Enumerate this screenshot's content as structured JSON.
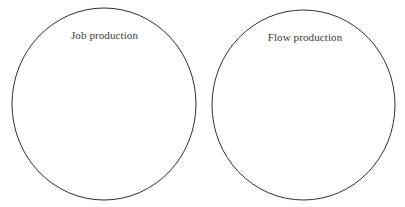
{
  "diagram": {
    "type": "two-set-venn-diagram",
    "background_color": "#ffffff",
    "stroke_color": "#2f2f2f",
    "stroke_width": 1,
    "label_color": "#3a3a3a",
    "shapes": [
      {
        "name": "job-production-circle",
        "label": "Job production",
        "cx": 104,
        "cy": 104,
        "rx": 92,
        "ry": 96
      },
      {
        "name": "flow-production-circle",
        "label": "Flow production",
        "cx": 303.5,
        "cy": 105,
        "rx": 91.5,
        "ry": 95
      }
    ]
  },
  "chart_data": {
    "type": "diagram",
    "title": "",
    "categories": [
      "Job production",
      "Flow production"
    ],
    "values": [
      null,
      null
    ]
  }
}
